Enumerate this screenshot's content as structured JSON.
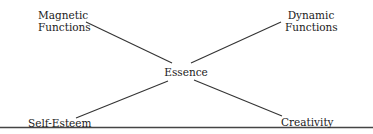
{
  "diagram": {
    "center": {
      "label": "Essence"
    },
    "nodes": [
      {
        "id": "magnetic",
        "label_line1": "Magnetic",
        "label_line2": "Functions",
        "position": "top-left"
      },
      {
        "id": "dynamic",
        "label_line1": "Dynamic",
        "label_line2": "Functions",
        "position": "top-right"
      },
      {
        "id": "self_esteem",
        "label": "Self-Esteem",
        "position": "bottom-left"
      },
      {
        "id": "creativity",
        "label": "Creativity",
        "position": "bottom-right"
      }
    ],
    "connections": [
      {
        "from": "magnetic",
        "to": "center"
      },
      {
        "from": "dynamic",
        "to": "center"
      },
      {
        "from": "self_esteem",
        "to": "center"
      },
      {
        "from": "creativity",
        "to": "center"
      }
    ],
    "colors": {
      "line": "#333333",
      "text": "#1a1a1a",
      "baseline": "#444444",
      "background": "#ffffff"
    }
  }
}
